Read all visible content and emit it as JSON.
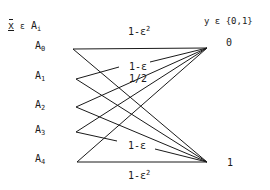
{
  "diagram": {
    "input_header": {
      "var": "x",
      "rel": "ε",
      "set": "A",
      "set_sub": "i"
    },
    "output_header": "y ε {0,1}",
    "inputs": [
      {
        "label": "A",
        "sub": "0"
      },
      {
        "label": "A",
        "sub": "1"
      },
      {
        "label": "A",
        "sub": "2"
      },
      {
        "label": "A",
        "sub": "3"
      },
      {
        "label": "A",
        "sub": "4"
      }
    ],
    "outputs": [
      "0",
      "1"
    ],
    "edge_labels": {
      "top": {
        "base": "1-ε",
        "sup": "2"
      },
      "a1_to_0": "1-ε",
      "a2_to_0": "1/2",
      "a3_to_1": "1-ε",
      "bottom": {
        "base": "1-ε",
        "sup": "2"
      }
    },
    "edges": [
      {
        "from": "A0",
        "to": "0",
        "label": "1-ε²"
      },
      {
        "from": "A0",
        "to": "1"
      },
      {
        "from": "A1",
        "to": "0",
        "label": "1-ε"
      },
      {
        "from": "A1",
        "to": "1"
      },
      {
        "from": "A2",
        "to": "0",
        "label": "1/2"
      },
      {
        "from": "A2",
        "to": "1"
      },
      {
        "from": "A3",
        "to": "0"
      },
      {
        "from": "A3",
        "to": "1",
        "label": "1-ε"
      },
      {
        "from": "A4",
        "to": "0"
      },
      {
        "from": "A4",
        "to": "1",
        "label": "1-ε²"
      }
    ]
  }
}
